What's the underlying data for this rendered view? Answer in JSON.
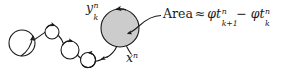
{
  "figure": {
    "width": 294,
    "height": 76,
    "background": "#ffffff",
    "stroke_color": "#1a1a1a",
    "shaded_circle_fill": "#cccccc"
  },
  "labels": {
    "y_label": {
      "base": "y",
      "superscript": "n",
      "subscript": "k"
    },
    "x_label": {
      "base": "x",
      "superscript": "n"
    }
  },
  "annotation": {
    "area_word": "Area",
    "approx_symbol": "≈",
    "term1": {
      "phi": "φ",
      "base": "t",
      "superscript": "n",
      "subscript": "k+1"
    },
    "minus_symbol": "−",
    "term2": {
      "phi": "φ",
      "base": "t",
      "superscript": "n",
      "subscript": "k"
    },
    "full_text": "Area ≈ φtⁿₖ₊₁ − φtⁿₖ"
  },
  "geometry": {
    "loops": [
      {
        "name": "loop-1",
        "cx": 22,
        "cy": 43,
        "r": 13
      },
      {
        "name": "loop-2",
        "cx": 52,
        "cy": 32,
        "r": 7
      },
      {
        "name": "loop-3",
        "cx": 70,
        "cy": 50,
        "r": 9
      },
      {
        "name": "loop-4",
        "cx": 88,
        "cy": 60,
        "r": 7.5
      },
      {
        "name": "shaded-loop",
        "cx": 120,
        "cy": 28,
        "r": 19
      }
    ],
    "leader_line": {
      "from": [
        163,
        16
      ],
      "to": [
        126,
        33
      ]
    }
  }
}
